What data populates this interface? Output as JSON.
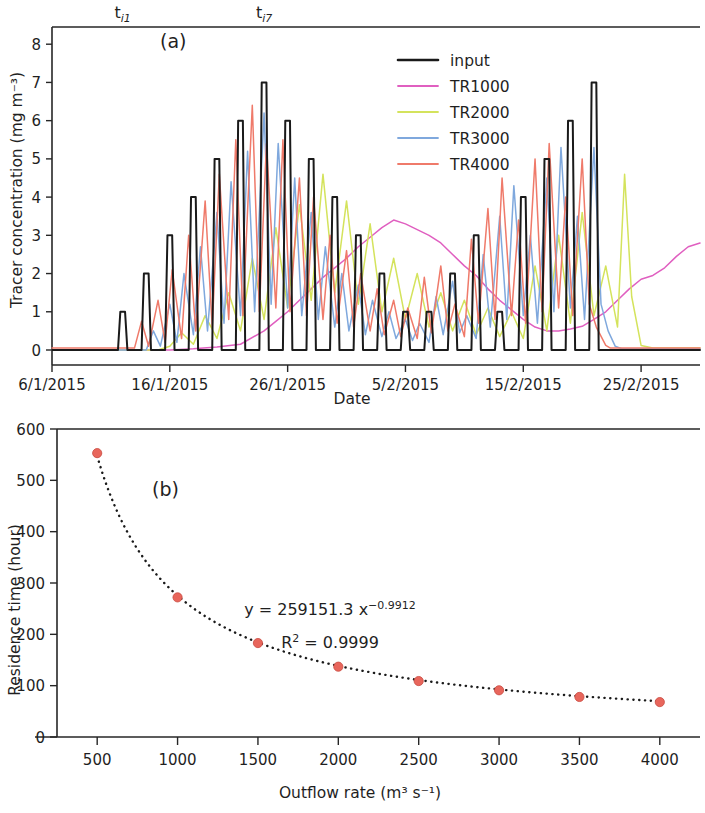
{
  "figure": {
    "panel_a_label": "(a)",
    "panel_b_label": "(b)"
  },
  "chart_data": [
    {
      "type": "line",
      "panel": "(a)",
      "title": "",
      "xlabel": "Date",
      "ylabel": "Tracer concentration (mg m⁻³)",
      "xlim": [
        0,
        55
      ],
      "ylim": [
        -0.35,
        8.45
      ],
      "yticks": [
        0,
        1,
        2,
        3,
        4,
        5,
        6,
        7,
        8
      ],
      "ytick_labels": [
        "0",
        "1",
        "2",
        "3",
        "4",
        "5",
        "6",
        "7",
        "8"
      ],
      "xticks": [
        0,
        10,
        20,
        30,
        40,
        50
      ],
      "xtick_labels": [
        "6/1/2015",
        "16/1/2015",
        "26/1/2015",
        "5/2/2015",
        "15/2/2015",
        "25/2/2015"
      ],
      "grid": false,
      "legend_position": "upper right",
      "annotations": [
        {
          "text": "t",
          "sub": "i1",
          "x": 6.0,
          "y": 8.9
        },
        {
          "text": "t",
          "sub": "i7",
          "x": 18.0,
          "y": 8.9
        }
      ],
      "series": [
        {
          "name": "input",
          "color": "#1a1a1a",
          "width": 2.0,
          "comment": "Square/trapezoidal daily input pulses of increasing then decreasing amplitude",
          "x": [
            0,
            5.6,
            5.8,
            6.2,
            6.4,
            7.6,
            7.8,
            8.2,
            8.4,
            9.6,
            9.8,
            10.2,
            10.4,
            11.6,
            11.8,
            12.2,
            12.4,
            13.6,
            13.8,
            14.2,
            14.4,
            15.6,
            15.8,
            16.2,
            16.4,
            17.6,
            17.8,
            18.2,
            18.4,
            19.6,
            19.8,
            20.2,
            20.4,
            21.6,
            21.8,
            22.2,
            22.4,
            23.6,
            23.8,
            24.2,
            24.4,
            25.6,
            25.8,
            26.2,
            26.4,
            27.6,
            27.8,
            28.2,
            28.4,
            29.6,
            29.8,
            30.2,
            30.4,
            31.6,
            31.8,
            32.2,
            32.4,
            33.6,
            33.8,
            34.2,
            34.4,
            35.6,
            35.8,
            36.2,
            36.4,
            37.6,
            37.8,
            38.2,
            38.4,
            39.6,
            39.8,
            40.2,
            40.4,
            41.6,
            41.8,
            42.2,
            42.4,
            43.6,
            43.8,
            44.2,
            44.4,
            45.6,
            45.8,
            46.2,
            46.4,
            55
          ],
          "y": [
            0,
            0,
            1,
            1,
            0,
            0,
            2,
            2,
            0,
            0,
            3,
            3,
            0,
            0,
            4,
            4,
            0,
            0,
            5,
            5,
            0,
            0,
            6,
            6,
            0,
            0,
            7,
            7,
            0,
            0,
            6,
            6,
            0,
            0,
            5,
            5,
            0,
            0,
            4,
            4,
            0,
            0,
            3,
            3,
            0,
            0,
            2,
            2,
            0,
            0,
            1,
            1,
            0,
            0,
            1,
            1,
            0,
            0,
            2,
            2,
            0,
            0,
            3,
            3,
            0,
            0,
            1,
            1,
            0,
            0,
            4,
            4,
            0,
            0,
            5,
            5,
            0,
            0,
            6,
            6,
            0,
            0,
            7,
            7,
            0,
            0
          ],
          "peaks": [
            1,
            2,
            3,
            4,
            5,
            6,
            7,
            6,
            5,
            4,
            3,
            2,
            1,
            1,
            2,
            3,
            1,
            4,
            5,
            6,
            7,
            8
          ]
        },
        {
          "name": "TR1000",
          "color": "#e05fc0",
          "width": 1.5,
          "comment": "Slow smooth rise, broad maximum ~3.4 near day 29, decline to ~0.5, late rise to ~2.8",
          "x": [
            0,
            10,
            12,
            14,
            16,
            18,
            19,
            20,
            21,
            22,
            23,
            24,
            25,
            26,
            27,
            28,
            29,
            30,
            31,
            32,
            33,
            34,
            35,
            36,
            37,
            38,
            39,
            40,
            41,
            42,
            43,
            44,
            45,
            46,
            47,
            48,
            49,
            50,
            51,
            52,
            53,
            54,
            55
          ],
          "y": [
            0,
            0,
            0.03,
            0.08,
            0.15,
            0.5,
            0.75,
            1.0,
            1.3,
            1.6,
            1.9,
            2.15,
            2.4,
            2.7,
            2.95,
            3.2,
            3.4,
            3.3,
            3.15,
            3.0,
            2.8,
            2.5,
            2.2,
            1.95,
            1.6,
            1.3,
            1.05,
            0.8,
            0.6,
            0.5,
            0.5,
            0.55,
            0.62,
            0.8,
            1.0,
            1.3,
            1.6,
            1.85,
            1.95,
            2.15,
            2.45,
            2.7,
            2.8
          ]
        },
        {
          "name": "TR2000",
          "color": "#d4e35c",
          "width": 1.5,
          "comment": "Damped oscillating response, late isolated spike ~4.6 near day 49",
          "x": [
            0,
            9,
            10,
            11,
            12,
            13,
            14,
            15,
            16,
            17,
            18,
            19,
            20,
            21,
            22,
            23,
            24,
            25,
            26,
            27,
            28,
            29,
            30,
            31,
            32,
            33,
            34,
            35,
            36,
            37,
            38,
            39,
            40,
            41,
            42,
            43,
            44,
            45,
            46,
            47,
            48,
            48.6,
            49.2,
            50,
            51,
            55
          ],
          "y": [
            0,
            0,
            0.1,
            0.45,
            0.15,
            0.9,
            0.3,
            1.5,
            0.5,
            2.4,
            0.8,
            3.2,
            1.1,
            3.8,
            1.3,
            4.6,
            1.5,
            3.9,
            1.2,
            3.3,
            1.0,
            2.4,
            0.8,
            2.0,
            0.6,
            1.5,
            0.5,
            1.3,
            0.4,
            1.1,
            0.35,
            1.0,
            0.3,
            2.2,
            0.5,
            3.0,
            0.7,
            3.6,
            0.9,
            2.2,
            0.6,
            4.6,
            1.4,
            0.12,
            0.05,
            0.05
          ]
        },
        {
          "name": "TR3000",
          "color": "#7fa8dd",
          "width": 1.5,
          "comment": "Faster response, peaks tracking input with ~1 day lag, max ~6.2 near day 21",
          "x": [
            0,
            8,
            8.6,
            9.2,
            10,
            10.6,
            11.2,
            12,
            12.6,
            13.2,
            14,
            14.6,
            15.2,
            16,
            16.6,
            17.2,
            18,
            18.6,
            19.2,
            20,
            20.6,
            21.2,
            22,
            22.6,
            23.2,
            24,
            24.6,
            25.2,
            26,
            26.6,
            27.2,
            28,
            28.6,
            29.2,
            30,
            30.6,
            31.2,
            32,
            32.6,
            33.2,
            34,
            34.6,
            35.2,
            36,
            36.6,
            37.2,
            38,
            38.6,
            39.2,
            40,
            40.6,
            41.2,
            42,
            42.6,
            43.2,
            44,
            44.6,
            45.2,
            46,
            46.6,
            47.2,
            47.8,
            48.4,
            55
          ],
          "y": [
            0,
            0,
            0.5,
            0.1,
            1.2,
            0.2,
            2.0,
            0.4,
            2.7,
            0.5,
            3.6,
            0.7,
            4.4,
            0.9,
            5.2,
            1.0,
            6.2,
            1.2,
            5.4,
            1.1,
            4.5,
            0.9,
            3.6,
            0.8,
            2.7,
            0.6,
            2.0,
            0.5,
            1.7,
            0.4,
            1.3,
            0.35,
            1.0,
            0.3,
            0.8,
            0.25,
            0.7,
            0.2,
            1.4,
            0.4,
            1.8,
            0.45,
            0.9,
            0.3,
            2.5,
            0.6,
            3.5,
            0.8,
            4.3,
            0.9,
            3.0,
            0.7,
            4.5,
            1.0,
            5.3,
            1.1,
            3.5,
            0.8,
            5.3,
            1.2,
            0.5,
            0.1,
            0.03,
            0.03
          ]
        },
        {
          "name": "TR4000",
          "color": "#ef7a6a",
          "width": 1.5,
          "comment": "Fastest response, sharp peaks closely following input, max ~6.4 near day 20",
          "x": [
            0,
            7,
            7.6,
            8.2,
            9,
            9.6,
            10.2,
            11,
            11.6,
            12.2,
            13,
            13.6,
            14.2,
            15,
            15.6,
            16.2,
            17,
            17.6,
            18.2,
            19,
            19.6,
            20.2,
            21,
            21.6,
            22.2,
            23,
            23.6,
            24.2,
            25,
            25.6,
            26.2,
            27,
            27.6,
            28.2,
            29,
            29.6,
            30.2,
            31,
            31.6,
            32.2,
            33,
            33.6,
            34.2,
            35,
            35.6,
            36.2,
            37,
            37.6,
            38.2,
            39,
            39.6,
            40.2,
            41,
            41.6,
            42.2,
            43,
            43.6,
            44.2,
            45,
            45.6,
            46.2,
            47,
            47.4,
            48,
            55
          ],
          "y": [
            0.05,
            0.05,
            0.75,
            0.1,
            1.3,
            0.2,
            2.1,
            0.3,
            3.0,
            0.5,
            3.9,
            0.6,
            4.6,
            0.8,
            5.5,
            0.9,
            6.4,
            1.0,
            5.4,
            1.1,
            5.5,
            1.0,
            4.5,
            0.9,
            4.0,
            0.8,
            3.0,
            0.7,
            2.6,
            0.6,
            2.0,
            0.5,
            1.6,
            0.4,
            1.3,
            0.35,
            1.1,
            0.3,
            1.9,
            0.45,
            2.2,
            0.5,
            1.2,
            0.35,
            2.9,
            0.7,
            3.7,
            0.8,
            4.5,
            0.9,
            3.4,
            0.7,
            5.0,
            1.0,
            5.4,
            1.1,
            4.0,
            0.9,
            5.0,
            1.2,
            0.6,
            0.12,
            0.05,
            0.05,
            0.05
          ]
        }
      ],
      "legend": [
        {
          "label": "input",
          "color": "#1a1a1a"
        },
        {
          "label": "TR1000",
          "color": "#e05fc0"
        },
        {
          "label": "TR2000",
          "color": "#d4e35c"
        },
        {
          "label": "TR3000",
          "color": "#7fa8dd"
        },
        {
          "label": "TR4000",
          "color": "#ef7a6a"
        }
      ]
    },
    {
      "type": "scatter",
      "panel": "(b)",
      "title": "",
      "xlabel": "Outflow rate (m³ s⁻¹)",
      "ylabel": "Residence time (hour)",
      "xlim": [
        250,
        4250
      ],
      "ylim": [
        0,
        600
      ],
      "xticks": [
        500,
        1000,
        1500,
        2000,
        2500,
        3000,
        3500,
        4000
      ],
      "xtick_labels": [
        "500",
        "1000",
        "1500",
        "2000",
        "2500",
        "3000",
        "3500",
        "4000"
      ],
      "yticks": [
        0,
        100,
        200,
        300,
        400,
        500,
        600
      ],
      "ytick_labels": [
        "0",
        "100",
        "200",
        "300",
        "400",
        "500",
        "600"
      ],
      "grid": false,
      "marker_color": "#e8665c",
      "marker_edge_color": "#c94a40",
      "fit_line_style": "dotted",
      "fit_line_color": "#1a1a1a",
      "x": [
        500,
        1000,
        1500,
        2000,
        2500,
        3000,
        3500,
        4000
      ],
      "y": [
        553,
        272,
        183,
        137,
        109,
        91,
        78,
        68
      ],
      "equation": "y = 259151.3 x",
      "equation_exponent": "−0.9912",
      "r2_label": "R",
      "r2_sup": "2",
      "r2_value": " = 0.9999",
      "fit_coefficient": 259151.3,
      "fit_exponent": -0.9912,
      "r_squared": 0.9999
    }
  ]
}
